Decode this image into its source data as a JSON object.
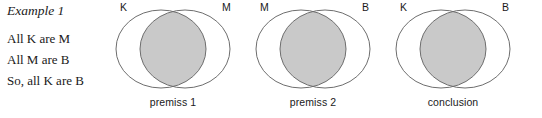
{
  "figure": {
    "title": "Example 1",
    "argument_lines": [
      "All K are M",
      "All M are B",
      "So, all K are B"
    ],
    "colors": {
      "shade": "#c9c9c9",
      "stroke": "#6e6e6e",
      "text": "#1a1a1a",
      "background": "#ffffff"
    },
    "diagrams": [
      {
        "caption": "premiss 1",
        "left_label": "K",
        "right_label": "M",
        "shaded_region": "left-only",
        "left_x": 116,
        "right_x": 230
      },
      {
        "caption": "premiss 2",
        "left_label": "M",
        "right_label": "B",
        "shaded_region": "left-only",
        "left_x": 256,
        "right_x": 370
      },
      {
        "caption": "conclusion",
        "left_label": "K",
        "right_label": "B",
        "shaded_region": "left-only",
        "left_x": 396,
        "right_x": 510
      }
    ]
  }
}
